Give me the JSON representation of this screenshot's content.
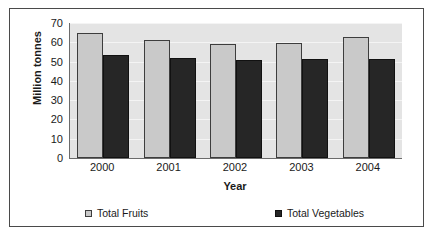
{
  "chart_data": {
    "type": "bar",
    "title": "",
    "xlabel": "Year",
    "ylabel": "Million tonnes",
    "categories": [
      "2000",
      "2001",
      "2002",
      "2003",
      "2004"
    ],
    "series": [
      {
        "name": "Total Fruits",
        "color": "#c9c9c9",
        "values": [
          65,
          61,
          59,
          59.5,
          63
        ]
      },
      {
        "name": "Total Vegetables",
        "color": "#262626",
        "values": [
          53.5,
          52,
          51,
          51.3,
          51.3
        ]
      }
    ],
    "ylim": [
      0,
      70
    ],
    "yticks": [
      0,
      10,
      20,
      30,
      40,
      50,
      60,
      70
    ],
    "ytick_labels": [
      "0",
      "10",
      "20",
      "30",
      "40",
      "50",
      "60",
      "70"
    ],
    "grid": true,
    "legend_position": "bottom",
    "plot_background": "#e4e4e4"
  }
}
